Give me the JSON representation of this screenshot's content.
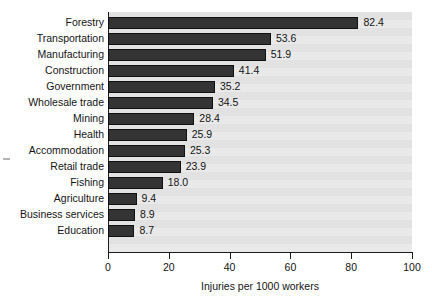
{
  "chart_data": {
    "type": "bar",
    "orientation": "horizontal",
    "title": "",
    "xlabel": "Injuries per 1000 workers",
    "ylabel": "",
    "xlim": [
      0,
      100
    ],
    "xticks": [
      "0",
      "20",
      "40",
      "60",
      "80",
      "100"
    ],
    "grid": false,
    "legend": null,
    "categories": [
      "Forestry",
      "Transportation",
      "Manufacturing",
      "Construction",
      "Government",
      "Wholesale trade",
      "Mining",
      "Health",
      "Accommodation",
      "Retail trade",
      "Fishing",
      "Agriculture",
      "Business services",
      "Education"
    ],
    "values": [
      82.4,
      53.6,
      51.9,
      41.4,
      35.2,
      34.5,
      28.4,
      25.9,
      25.3,
      23.9,
      18.0,
      9.4,
      8.9,
      8.7
    ],
    "value_labels": [
      "82.4",
      "53.6",
      "51.9",
      "41.4",
      "35.2",
      "34.5",
      "28.4",
      "25.9",
      "25.3",
      "23.9",
      "18.0",
      "9.4",
      "8.9",
      "8.7"
    ],
    "bar_color": "#343434",
    "plot_background": "#e9e9e9",
    "page_background": "#ffffff",
    "axis_color": "#1a1a1a"
  }
}
